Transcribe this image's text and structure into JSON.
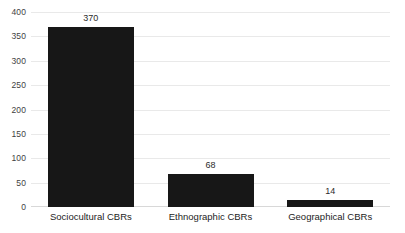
{
  "chart_data": {
    "type": "bar",
    "title": "",
    "subtitle": "",
    "xlabel": "",
    "ylabel": "",
    "categories": [
      "Sociocultural CBRs",
      "Ethnographic CBRs",
      "Geographical CBRs"
    ],
    "values": [
      370,
      68,
      14
    ],
    "data_labels": [
      "370",
      "68",
      "14"
    ],
    "ylim": [
      0,
      400
    ],
    "ytick_values": [
      0,
      50,
      100,
      150,
      200,
      250,
      300,
      350,
      400
    ],
    "ytick_labels": [
      "0",
      "50",
      "100",
      "150",
      "200",
      "250",
      "300",
      "350",
      "400"
    ],
    "grid": "horizontal",
    "legend": "none",
    "orientation": "vertical",
    "bar_color": "#171717",
    "gridline_color": "#e9e9e9",
    "axis_color": "#d8d8d8",
    "background_color": "#ffffff",
    "text_color": "#2b2b2b"
  }
}
